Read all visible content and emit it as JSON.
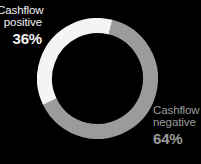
{
  "background_color": "#000000",
  "chart_data": {
    "type": "pie",
    "variant": "donut",
    "title": "",
    "xlabel": "",
    "ylabel": "",
    "legend_position": "inline-annotations",
    "grid": false,
    "units": "percent",
    "total": 100,
    "start_angle_deg": 14,
    "direction": "clockwise",
    "inner_radius_ratio": 0.75,
    "categories": [
      "Cashflow negative",
      "Cashflow positive"
    ],
    "values": [
      64,
      36
    ],
    "colors": [
      "#9b9b9b",
      "#f4f4f4"
    ],
    "slices": [
      {
        "name": "Cashflow negative",
        "value": 64,
        "label": "64%",
        "color": "#9b9b9b",
        "start_angle_deg": 14,
        "sweep_deg": 230.4
      },
      {
        "name": "Cashflow positive",
        "value": 36,
        "label": "36%",
        "color": "#f4f4f4",
        "start_angle_deg": 244.4,
        "sweep_deg": 129.6
      }
    ]
  },
  "annotations": {
    "positive": {
      "line1": "Cashflow",
      "line2": "positive",
      "value": "36%",
      "color": "#f2f2f2"
    },
    "negative": {
      "line1": "Cashflow",
      "line2": "negative",
      "value": "64%",
      "color": "#9b9b9b"
    }
  }
}
